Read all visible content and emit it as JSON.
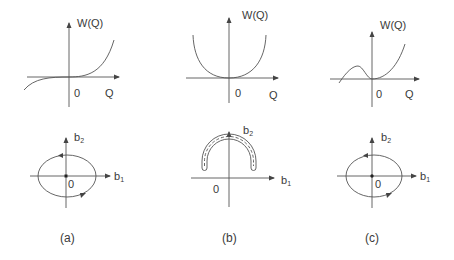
{
  "figure": {
    "panels": [
      {
        "id": "a",
        "caption": "(a)",
        "potential": {
          "y_label": "W(Q)",
          "x_label": "Q",
          "origin_label": "0",
          "shape": "monotonic cubic-like, inflection at origin"
        },
        "phase": {
          "y_label": "b",
          "y_sub": "2",
          "x_label": "b",
          "x_sub": "1",
          "origin_label": "0",
          "shape": "closed ellipse orbit around origin"
        }
      },
      {
        "id": "b",
        "caption": "(b)",
        "potential": {
          "y_label": "W(Q)",
          "x_label": "Q",
          "origin_label": "0",
          "shape": "U-shaped well, minimum at origin"
        },
        "phase": {
          "y_label": "b",
          "y_sub": "2",
          "x_label": "b",
          "x_sub": "1",
          "origin_label": "0",
          "shape": "arch-shaped band above b1 axis"
        }
      },
      {
        "id": "c",
        "caption": "(c)",
        "potential": {
          "y_label": "W(Q)",
          "x_label": "Q",
          "origin_label": "0",
          "shape": "local max at negative Q, local min at origin"
        },
        "phase": {
          "y_label": "b",
          "y_sub": "2",
          "x_label": "b",
          "x_sub": "1",
          "origin_label": "0",
          "shape": "closed ellipse orbit around origin"
        }
      }
    ]
  }
}
